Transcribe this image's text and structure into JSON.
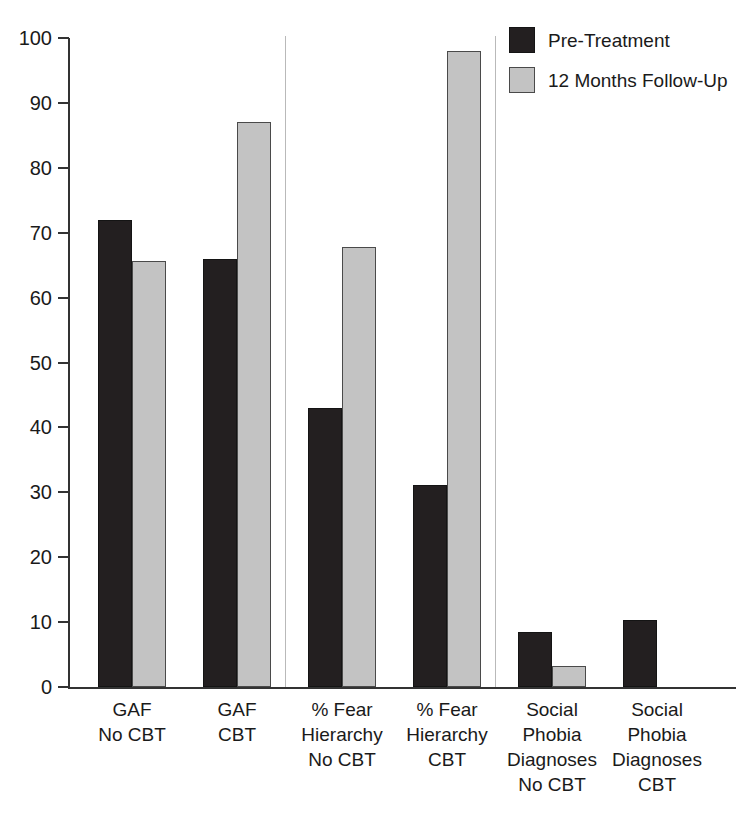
{
  "chart_data": {
    "type": "bar",
    "title": "",
    "subtitle": "",
    "xlabel": "",
    "ylabel": "",
    "ylim": [
      0,
      100
    ],
    "ytick_labels": [
      "0",
      "10",
      "20",
      "30",
      "40",
      "50",
      "60",
      "70",
      "80",
      "90",
      "100"
    ],
    "ytick_values": [
      0,
      10,
      20,
      30,
      40,
      50,
      60,
      70,
      80,
      90,
      100
    ],
    "grid": false,
    "legend_position": "top-right",
    "categories": [
      "GAF\nNo CBT",
      "GAF\nCBT",
      "% Fear\nHierarchy\nNo CBT",
      "% Fear\nHierarchy\nCBT",
      "Social\nPhobia\nDiagnoses\nNo CBT",
      "Social\nPhobia\nDiagnoses\nCBT"
    ],
    "series": [
      {
        "name": "Pre-Treatment",
        "color": "#231f20",
        "values": [
          72,
          66,
          43,
          31.2,
          8.4,
          10.3
        ]
      },
      {
        "name": "12 Months Follow-Up",
        "color": "#c3c3c3",
        "values": [
          65.7,
          87,
          67.8,
          98,
          3.3,
          0
        ]
      }
    ],
    "group_separators_after": [
      1,
      3
    ],
    "annotations": []
  },
  "legend": {
    "items": [
      {
        "label": "Pre-Treatment",
        "swatch": "dark"
      },
      {
        "label": "12 Months Follow-Up",
        "swatch": "light"
      }
    ]
  }
}
